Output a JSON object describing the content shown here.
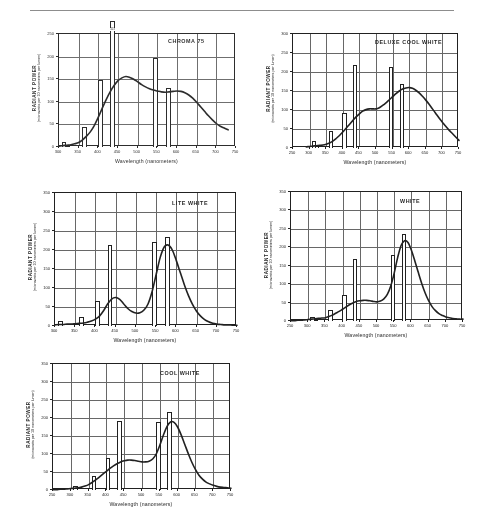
{
  "figure": {
    "xlabel": "Wavelength (nanometers)",
    "ylabel_main": "RADIANT POWER",
    "ylabel_sub": "(microwatts per 10 nanometers per lumen)"
  },
  "chart_data": [
    {
      "id": "chroma-75",
      "type": "bar",
      "title": "CHROMA 75",
      "xlabel": "Wavelength (nanometers)",
      "ylabel": "RADIANT POWER (microwatts per 10 nanometers per lumen)",
      "xlim": [
        300,
        750
      ],
      "ylim": [
        0,
        250
      ],
      "xticks": [
        300,
        350,
        400,
        450,
        500,
        550,
        600,
        650,
        700,
        750
      ],
      "yticks": [
        0,
        50,
        100,
        150,
        200,
        250
      ],
      "grid": true,
      "bars": [
        {
          "x": 313,
          "value": 12
        },
        {
          "x": 322,
          "value": 3
        },
        {
          "x": 365,
          "value": 45
        },
        {
          "x": 405,
          "value": 148
        },
        {
          "x": 436,
          "value": 290,
          "clipped": true,
          "label": "413"
        },
        {
          "x": 546,
          "value": 196
        },
        {
          "x": 578,
          "value": 130
        }
      ],
      "curve": {
        "x": [
          300,
          310,
          320,
          330,
          340,
          350,
          360,
          370,
          380,
          390,
          400,
          410,
          420,
          430,
          440,
          450,
          460,
          470,
          480,
          490,
          500,
          510,
          520,
          530,
          540,
          550,
          560,
          570,
          580,
          590,
          600,
          610,
          620,
          630,
          640,
          650,
          660,
          670,
          680,
          690,
          700,
          710,
          720,
          730
        ],
        "y": [
          2,
          3,
          4,
          5,
          7,
          10,
          16,
          24,
          34,
          48,
          66,
          86,
          105,
          122,
          136,
          147,
          153,
          156,
          154,
          150,
          144,
          138,
          133,
          129,
          126,
          124,
          122,
          121,
          122,
          123,
          124,
          123,
          120,
          115,
          108,
          99,
          89,
          79,
          69,
          60,
          52,
          46,
          42,
          38
        ]
      }
    },
    {
      "id": "deluxe-cool-white",
      "type": "bar",
      "title": "DELUXE COOL WHITE",
      "xlabel": "Wavelength (nanometers)",
      "ylabel": "RADIANT POWER (microwatts per 10 nanometers per lumen)",
      "xlim": [
        250,
        750
      ],
      "ylim": [
        0,
        300
      ],
      "xticks": [
        250,
        300,
        350,
        400,
        450,
        500,
        550,
        600,
        650,
        700,
        750
      ],
      "yticks": [
        0,
        50,
        100,
        150,
        200,
        250,
        300
      ],
      "grid": true,
      "bars": [
        {
          "x": 313,
          "value": 18
        },
        {
          "x": 322,
          "value": 4
        },
        {
          "x": 365,
          "value": 45
        },
        {
          "x": 405,
          "value": 92
        },
        {
          "x": 436,
          "value": 218
        },
        {
          "x": 546,
          "value": 212
        },
        {
          "x": 578,
          "value": 168
        }
      ],
      "curve": {
        "x": [
          290,
          300,
          310,
          320,
          330,
          340,
          350,
          360,
          370,
          380,
          390,
          400,
          410,
          420,
          430,
          440,
          450,
          460,
          470,
          480,
          490,
          500,
          510,
          520,
          530,
          540,
          550,
          560,
          570,
          580,
          590,
          600,
          610,
          620,
          630,
          640,
          650,
          660,
          670,
          680,
          690,
          700,
          710,
          720,
          730,
          740,
          750
        ],
        "y": [
          3,
          4,
          5,
          6,
          7,
          8,
          10,
          13,
          18,
          25,
          33,
          42,
          52,
          62,
          72,
          82,
          90,
          97,
          101,
          103,
          103,
          103,
          106,
          112,
          119,
          127,
          135,
          143,
          150,
          155,
          158,
          159,
          157,
          152,
          145,
          136,
          126,
          115,
          103,
          91,
          79,
          68,
          57,
          47,
          38,
          29,
          20
        ]
      }
    },
    {
      "id": "lite-white",
      "type": "bar",
      "title": "LITE WHITE",
      "xlabel": "Wavelength (nanometers)",
      "ylabel": "RADIANT POWER (microwatts per 10 nanometers per lumen)",
      "xlim": [
        300,
        750
      ],
      "ylim": [
        0,
        350
      ],
      "xticks": [
        300,
        350,
        400,
        450,
        500,
        550,
        600,
        650,
        700,
        750
      ],
      "yticks": [
        0,
        50,
        100,
        150,
        200,
        250,
        300,
        350
      ],
      "grid": true,
      "bars": [
        {
          "x": 313,
          "value": 14
        },
        {
          "x": 365,
          "value": 25
        },
        {
          "x": 405,
          "value": 65
        },
        {
          "x": 436,
          "value": 212
        },
        {
          "x": 546,
          "value": 220
        },
        {
          "x": 578,
          "value": 235
        }
      ],
      "curve": {
        "x": [
          300,
          310,
          320,
          330,
          340,
          350,
          360,
          370,
          380,
          390,
          400,
          410,
          420,
          430,
          440,
          450,
          460,
          470,
          480,
          490,
          500,
          510,
          520,
          530,
          540,
          550,
          560,
          570,
          580,
          590,
          600,
          610,
          620,
          630,
          640,
          650,
          660,
          670,
          680,
          690,
          700,
          710,
          720,
          730,
          740,
          750
        ],
        "y": [
          3,
          4,
          4,
          5,
          5,
          6,
          7,
          8,
          10,
          13,
          18,
          26,
          40,
          58,
          71,
          75,
          70,
          58,
          46,
          38,
          34,
          35,
          42,
          58,
          90,
          135,
          180,
          208,
          213,
          200,
          172,
          140,
          108,
          80,
          57,
          39,
          26,
          17,
          11,
          7,
          5,
          4,
          3,
          3,
          2,
          2
        ]
      }
    },
    {
      "id": "white",
      "type": "bar",
      "title": "WHITE",
      "xlabel": "Wavelength (nanometers)",
      "ylabel": "RADIANT POWER (microwatts per 10 nanometers per lumen)",
      "xlim": [
        250,
        750
      ],
      "ylim": [
        0,
        350
      ],
      "xticks": [
        250,
        300,
        350,
        400,
        450,
        500,
        550,
        600,
        650,
        700,
        750
      ],
      "yticks": [
        0,
        50,
        100,
        150,
        200,
        250,
        300,
        350
      ],
      "grid": true,
      "bars": [
        {
          "x": 313,
          "value": 11
        },
        {
          "x": 322,
          "value": 3
        },
        {
          "x": 365,
          "value": 30
        },
        {
          "x": 405,
          "value": 71
        },
        {
          "x": 436,
          "value": 168
        },
        {
          "x": 546,
          "value": 180
        },
        {
          "x": 578,
          "value": 237
        }
      ],
      "curve": {
        "x": [
          250,
          260,
          270,
          280,
          290,
          300,
          310,
          320,
          330,
          340,
          350,
          360,
          370,
          380,
          390,
          400,
          410,
          420,
          430,
          440,
          450,
          460,
          470,
          480,
          490,
          500,
          510,
          520,
          530,
          540,
          550,
          560,
          570,
          580,
          590,
          600,
          610,
          620,
          630,
          640,
          650,
          660,
          670,
          680,
          690,
          700,
          710,
          720,
          730,
          740,
          750
        ],
        "y": [
          1,
          1,
          2,
          2,
          3,
          4,
          5,
          6,
          7,
          8,
          9,
          12,
          16,
          21,
          26,
          32,
          38,
          44,
          49,
          53,
          55,
          56,
          56,
          55,
          53,
          52,
          54,
          60,
          72,
          95,
          130,
          172,
          205,
          218,
          213,
          192,
          163,
          132,
          102,
          76,
          55,
          39,
          28,
          20,
          15,
          11,
          9,
          7,
          6,
          5,
          5
        ]
      }
    },
    {
      "id": "cool-white",
      "type": "bar",
      "title": "COOL WHITE",
      "xlabel": "Wavelength (nanometers)",
      "ylabel": "RADIANT POWER (microwatts per 10 nanometers per lumen)",
      "xlim": [
        250,
        750
      ],
      "ylim": [
        0,
        350
      ],
      "xticks": [
        250,
        300,
        350,
        400,
        450,
        500,
        550,
        600,
        650,
        700,
        750
      ],
      "yticks": [
        0,
        50,
        100,
        150,
        200,
        250,
        300,
        350
      ],
      "grid": true,
      "bars": [
        {
          "x": 313,
          "value": 11
        },
        {
          "x": 365,
          "value": 40
        },
        {
          "x": 405,
          "value": 90
        },
        {
          "x": 436,
          "value": 193
        },
        {
          "x": 546,
          "value": 188
        },
        {
          "x": 578,
          "value": 217
        }
      ],
      "curve": {
        "x": [
          250,
          260,
          270,
          280,
          290,
          300,
          310,
          320,
          330,
          340,
          350,
          360,
          370,
          380,
          390,
          400,
          410,
          420,
          430,
          440,
          450,
          460,
          470,
          480,
          490,
          500,
          510,
          520,
          530,
          540,
          550,
          560,
          570,
          580,
          590,
          600,
          610,
          620,
          630,
          640,
          650,
          660,
          670,
          680,
          690,
          700,
          710,
          720,
          730,
          740,
          750
        ],
        "y": [
          1,
          1,
          2,
          2,
          3,
          4,
          5,
          6,
          8,
          11,
          15,
          21,
          28,
          36,
          44,
          52,
          60,
          67,
          73,
          78,
          81,
          83,
          83,
          82,
          80,
          78,
          78,
          80,
          86,
          100,
          124,
          152,
          176,
          189,
          188,
          175,
          153,
          127,
          101,
          77,
          57,
          41,
          30,
          22,
          17,
          13,
          10,
          8,
          7,
          6,
          5
        ]
      }
    }
  ]
}
